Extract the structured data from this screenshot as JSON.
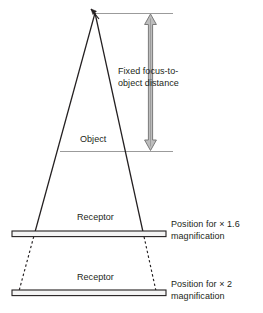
{
  "diagram": {
    "colors": {
      "ink": "#231f20",
      "gray_line": "#9b9b9b",
      "arrow_fill": "#b3b3b3",
      "arrow_stroke": "#6e6e6e",
      "background": "#ffffff"
    },
    "labels": {
      "fixed_distance": "Fixed focus-to-object distance",
      "object": "Object",
      "receptor_upper": "Receptor",
      "receptor_lower": "Receptor",
      "position_upper": "Position for × 1.6 magnification",
      "position_lower": "Position for × 2 magnification"
    },
    "magnifications": {
      "upper": "× 1.6",
      "lower": "× 2"
    },
    "elements": {
      "focus_point": "focus-apex-arrow",
      "beam": "x-ray-beam-cone",
      "beam_extension": "dashed-beam-extension",
      "distance_arrow": "double-headed-vertical-arrow",
      "reference_line_top": "focus-reference-line",
      "object_plane": "object-plane-line",
      "receptor_bar_upper": "receptor-bar",
      "receptor_bar_lower": "receptor-bar"
    }
  }
}
